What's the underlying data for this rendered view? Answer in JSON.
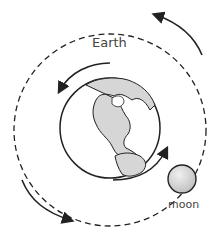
{
  "diagram": {
    "labels": {
      "earth": "Earth",
      "moon": "moon"
    },
    "colors": {
      "stroke": "#222222",
      "moon_fill": "#cfcfcf",
      "land_fill": "#d6d6d6",
      "background": "#ffffff"
    },
    "elements": [
      "earth-globe",
      "moon",
      "dashed-moon-orbit",
      "earth-rotation-arrows",
      "moon-orbit-arrows"
    ]
  }
}
